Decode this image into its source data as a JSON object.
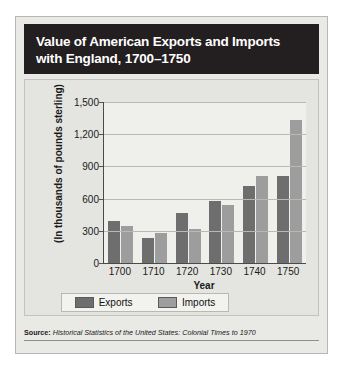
{
  "card": {
    "title": "Value of American Exports and Imports with England, 1700–1750",
    "source_label": "Source:",
    "source_text": "Historical Statistics of the United States: Colonial Times to 1970"
  },
  "legend": {
    "items": [
      {
        "label": "Exports",
        "color": "#6e6e6e"
      },
      {
        "label": "Imports",
        "color": "#9d9d9d"
      }
    ]
  },
  "chart_data": {
    "type": "bar",
    "title": "Value of American Exports and Imports with England, 1700–1750",
    "xlabel": "Year",
    "ylabel": "(In thousands of pounds sterling)",
    "categories": [
      "1700",
      "1710",
      "1720",
      "1730",
      "1740",
      "1750"
    ],
    "series": [
      {
        "name": "Exports",
        "color": "#6e6e6e",
        "values": [
          395,
          235,
          470,
          575,
          720,
          810
        ]
      },
      {
        "name": "Imports",
        "color": "#9d9d9d",
        "values": [
          345,
          275,
          320,
          545,
          810,
          1330
        ]
      }
    ],
    "ylim": [
      0,
      1500
    ],
    "yticks": [
      "0",
      "300",
      "600",
      "900",
      "1,200",
      "1,500"
    ],
    "ytick_values": [
      0,
      300,
      600,
      900,
      1200,
      1500
    ],
    "grid": true,
    "legend_position": "bottom"
  }
}
